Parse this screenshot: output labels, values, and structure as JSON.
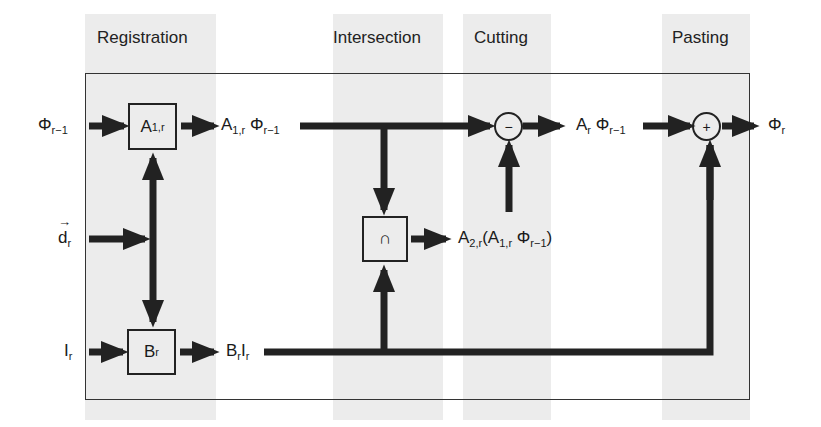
{
  "stages": [
    {
      "label": "Registration"
    },
    {
      "label": "Intersection"
    },
    {
      "label": "Cutting"
    },
    {
      "label": "Pasting"
    }
  ],
  "inputs": {
    "phi_prev": {
      "base": "Φ",
      "sub": "r−1"
    },
    "d": {
      "base": "d",
      "sub": "r",
      "vector": "→"
    },
    "I": {
      "base": "I",
      "sub": "r"
    }
  },
  "blocks": {
    "A1r": {
      "base": "A",
      "sub": "1,r"
    },
    "Br": {
      "base": "B",
      "sub": "r"
    },
    "intersect": {
      "symbol": "∩"
    },
    "minus": {
      "symbol": "−"
    },
    "plus": {
      "symbol": "+"
    }
  },
  "signals": {
    "A1r_phi": {
      "a": "A",
      "a_sub": "1,r",
      "phi": "Φ",
      "phi_sub": "r−1"
    },
    "BrIr": {
      "b": "B",
      "b_sub": "r",
      "i": "I",
      "i_sub": "r"
    },
    "A2r": {
      "a2": "A",
      "a2_sub": "2,r",
      "open": "(",
      "a1": "A",
      "a1_sub": "1,r",
      "phi": "Φ",
      "phi_sub": "r−1",
      "close": ")"
    },
    "Ar_phi": {
      "a": "A",
      "a_sub": "r",
      "phi": "Φ",
      "phi_sub": "r−1"
    },
    "phi_out": {
      "base": "Φ",
      "sub": "r"
    }
  },
  "colors": {
    "band": "#ececec",
    "line": "#222222",
    "frame": "#333333"
  }
}
